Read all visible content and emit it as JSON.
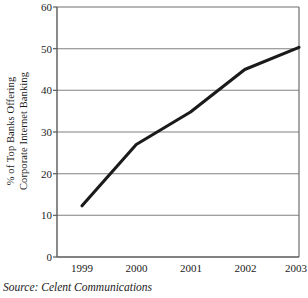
{
  "chart_data": {
    "type": "line",
    "title": "",
    "subtitle": "",
    "xlabel": "",
    "ylabel": "% of Top Banks Offering Corporate Internet Banking",
    "ylabel_lines": [
      "% of Top Banks Offering",
      "Corporate Internet Banking"
    ],
    "categories": [
      "1999",
      "2000",
      "2001",
      "2002",
      "2003"
    ],
    "x": [
      1999,
      2000,
      2001,
      2002,
      2003
    ],
    "values": [
      12.3,
      27.0,
      34.8,
      45.0,
      50.3
    ],
    "series": [
      {
        "name": "% of Top Banks Offering Corporate Internet Banking",
        "values": [
          12.3,
          27.0,
          34.8,
          45.0,
          50.3
        ]
      }
    ],
    "ylim": [
      0,
      60
    ],
    "yticks": [
      0,
      10,
      20,
      30,
      40,
      50,
      60
    ],
    "ytick_labels": [
      "0",
      "10",
      "20",
      "30",
      "40",
      "50",
      "60"
    ],
    "xtick_labels": [
      "1999",
      "2000",
      "2001",
      "2002",
      "2003"
    ],
    "grid": "horizontal",
    "legend": "none",
    "line_color": "#1a1a1a",
    "line_width": 3,
    "markers": "none",
    "plot_background": "#ffffff",
    "grid_color": "#808080",
    "axis_color": "#595959"
  },
  "source": {
    "text": "Source: Celent Communications"
  }
}
